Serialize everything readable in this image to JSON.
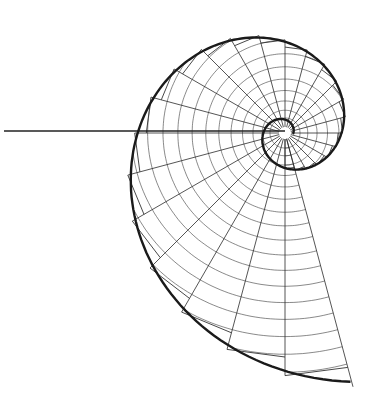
{
  "diagram": {
    "title": "Logarithmic spiral construction",
    "type": "equiangular-spiral-construction",
    "canvas": {
      "width": 384,
      "height": 415,
      "background": "#ffffff"
    },
    "colors": {
      "spiral": "#1a1a1a",
      "radial": "#2a2a2a",
      "arc": "#3a3a3a",
      "chord": "#333333",
      "axis": "#222222"
    },
    "center": {
      "x": 285,
      "y": 133
    },
    "spiral": {
      "r0": 35,
      "growth_per_radian": 0.305,
      "start_angle_deg": 90,
      "inner_turn_start_r": 8,
      "end_sweep_deg": 375,
      "stroke_width": 2.4
    },
    "radials": {
      "step_deg": 15,
      "count": 26,
      "stroke_width": 0.8
    },
    "arcs": {
      "count": 18,
      "stroke_width": 0.6
    },
    "axis_line": {
      "x1": 4,
      "y1": 131,
      "x2": 285,
      "y2": 131,
      "stroke_width": 1.3
    }
  }
}
